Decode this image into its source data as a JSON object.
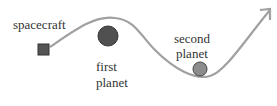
{
  "diagram": {
    "labels": {
      "spacecraft": "spacecraft",
      "first_planet_line1": "first",
      "first_planet_line2": "planet",
      "second_planet_line1": "second",
      "second_planet_line2": "planet"
    },
    "colors": {
      "path": "#a0a0a0",
      "spacecraft": "#555555",
      "first_planet": "#505050",
      "second_planet": "#8c8c8c"
    }
  }
}
